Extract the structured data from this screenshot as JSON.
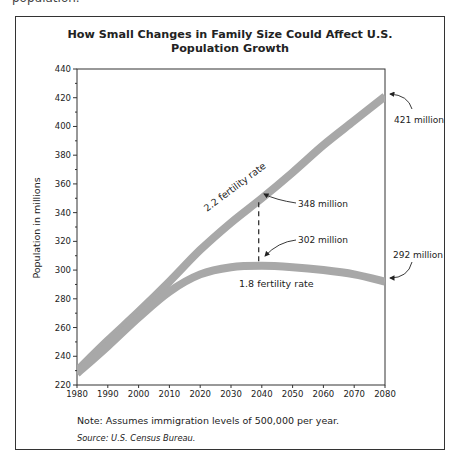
{
  "header": {
    "cut_text": "population."
  },
  "chart_data": {
    "type": "line",
    "title": "How Small Changes in Family Size Could Affect U.S. Population Growth",
    "title_lines": [
      "How Small Changes in Family Size Could Affect U.S.",
      "Population Growth"
    ],
    "xlabel": "",
    "ylabel": "Population in millions",
    "xlim": [
      1980,
      2080
    ],
    "ylim": [
      220,
      440
    ],
    "x_ticks": [
      1980,
      1990,
      2000,
      2010,
      2020,
      2030,
      2040,
      2050,
      2060,
      2070,
      2080
    ],
    "y_ticks": [
      220,
      240,
      260,
      280,
      300,
      320,
      340,
      360,
      380,
      400,
      420,
      440
    ],
    "grid": false,
    "x": [
      1980,
      1990,
      2000,
      2010,
      2020,
      2030,
      2040,
      2050,
      2060,
      2070,
      2080
    ],
    "series": [
      {
        "name": "2.2 fertility rate",
        "values": [
          230,
          251,
          271,
          292,
          314,
          333,
          350,
          368,
          387,
          404,
          421
        ]
      },
      {
        "name": "1.8 fertility rate",
        "values": [
          228,
          247,
          267,
          285,
          297,
          302,
          303,
          302,
          300,
          297,
          292
        ]
      }
    ],
    "annotations": [
      {
        "text": "421 million",
        "x": 2080,
        "y": 421,
        "series": "2.2 fertility rate"
      },
      {
        "text": "348 million",
        "x": 2039,
        "y": 348,
        "series": "2.2 fertility rate"
      },
      {
        "text": "302 million",
        "x": 2039,
        "y": 302,
        "series": "1.8 fertility rate"
      },
      {
        "text": "292 million",
        "x": 2080,
        "y": 292,
        "series": "1.8 fertility rate"
      }
    ],
    "series_labels": [
      "2.2 fertility rate",
      "1.8 fertility rate"
    ],
    "colors": {
      "series": "#a8a8a8",
      "axis": "#333333",
      "text": "#222222"
    }
  },
  "footer": {
    "note": "Note: Assumes immigration levels of 500,000 per year.",
    "source": "Source: U.S. Census Bureau."
  }
}
